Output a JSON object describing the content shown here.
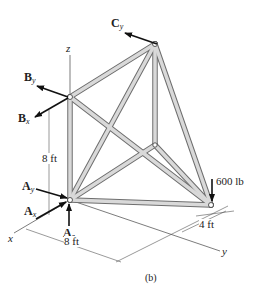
{
  "figure": {
    "caption": "(b)",
    "axes": {
      "x": "x",
      "y": "y",
      "z": "z"
    },
    "forces": {
      "Cy": {
        "base": "C",
        "sub": "y"
      },
      "By": {
        "base": "B",
        "sub": "y"
      },
      "Bx": {
        "base": "B",
        "sub": "x"
      },
      "Ay": {
        "base": "A",
        "sub": "y"
      },
      "Ax": {
        "base": "A",
        "sub": "x"
      },
      "Az": {
        "base": "A",
        "sub": "z"
      }
    },
    "load": "600 lb",
    "dimensions": {
      "height": "8 ft",
      "length": "8 ft",
      "width": "4 ft"
    },
    "colors": {
      "member_fill": "#d4d4d4",
      "member_edge": "#6e6e6e",
      "ink": "#222222"
    }
  }
}
